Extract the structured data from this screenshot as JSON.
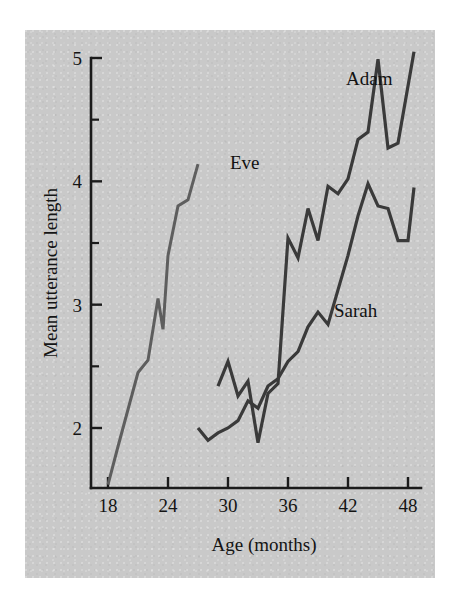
{
  "figure": {
    "background": "#ffffff",
    "plate_color": "#c9c9c9",
    "ink_color": "#3a3a3a"
  },
  "chart_data": {
    "type": "line",
    "title": "",
    "xlabel": "Age (months)",
    "ylabel": "Mean utterance length",
    "xlim": [
      17,
      49.5
    ],
    "ylim": [
      1.5,
      5.1
    ],
    "xticks": [
      18,
      24,
      30,
      36,
      42,
      48
    ],
    "xtick_labels": [
      "18",
      "24",
      "30",
      "36",
      "42",
      "48"
    ],
    "yticks": [
      2,
      3,
      4,
      5
    ],
    "ytick_labels": [
      "2",
      "3",
      "4",
      "5"
    ],
    "yticks_minor": [
      2.5,
      3.5,
      4.5
    ],
    "grid": false,
    "legend": "inline-labels",
    "series": [
      {
        "name": "Eve",
        "color": "#5e5e5e",
        "width": 3.0,
        "label_x": 30.2,
        "label_y": 4.1,
        "x": [
          18,
          19,
          20,
          21,
          22,
          23,
          23.5,
          24,
          25,
          26,
          27
        ],
        "y": [
          1.54,
          1.85,
          2.15,
          2.45,
          2.55,
          3.05,
          2.8,
          3.4,
          3.8,
          3.85,
          4.14
        ]
      },
      {
        "name": "Sarah",
        "color": "#3a3a3a",
        "width": 3.2,
        "label_x": 40.6,
        "label_y": 2.9,
        "x": [
          27,
          28,
          29,
          30,
          31,
          32,
          33,
          34,
          35,
          36,
          37,
          38,
          39,
          40,
          41,
          42,
          43,
          44,
          45,
          46,
          47,
          48,
          48.6
        ],
        "y": [
          2.0,
          1.9,
          1.96,
          2.0,
          2.06,
          2.22,
          2.16,
          2.34,
          2.4,
          2.54,
          2.62,
          2.82,
          2.94,
          2.84,
          3.12,
          3.4,
          3.72,
          3.98,
          3.8,
          3.78,
          3.52,
          3.52,
          3.95
        ]
      },
      {
        "name": "Adam",
        "color": "#3a3a3a",
        "width": 3.2,
        "label_x": 41.8,
        "label_y": 4.78,
        "x": [
          29,
          30,
          31,
          32,
          33,
          34,
          35,
          36,
          37,
          38,
          39,
          40,
          41,
          42,
          43,
          44,
          45,
          46,
          47,
          48.6
        ],
        "y": [
          2.34,
          2.54,
          2.26,
          2.38,
          1.88,
          2.28,
          2.36,
          3.54,
          3.38,
          3.78,
          3.52,
          3.96,
          3.9,
          4.02,
          4.34,
          4.4,
          4.99,
          4.27,
          4.31,
          5.05
        ]
      }
    ]
  },
  "labels": {
    "eve": "Eve",
    "sarah": "Sarah",
    "adam": "Adam"
  }
}
